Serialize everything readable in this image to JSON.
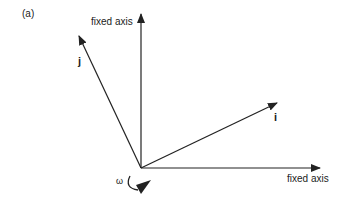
{
  "figure": {
    "panel_label": "(a)",
    "axes": {
      "vertical_fixed_axis_label": "fixed axis",
      "horizontal_fixed_axis_label": "fixed axis",
      "i_vector_label": "i",
      "j_vector_label": "j"
    },
    "rotation_symbol": "ω",
    "colors": {
      "line": "#222222",
      "background": "#ffffff"
    }
  }
}
